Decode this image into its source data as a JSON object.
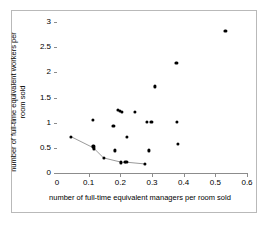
{
  "chart_data": {
    "type": "scatter",
    "title": "",
    "xlabel": "number of full-time equivalent managers per room sold",
    "ylabel": "number of full-time equivalent workers per room sold",
    "xlim": [
      0,
      0.6
    ],
    "ylim": [
      0,
      3
    ],
    "xticks": [
      "0",
      "0.1",
      "0.2",
      "0.3",
      "0.4",
      "0.5",
      "0.6"
    ],
    "xtick_values": [
      0,
      0.1,
      0.2,
      0.3,
      0.4,
      0.5,
      0.6
    ],
    "yticks": [
      "0",
      "0.5",
      "1",
      "1.5",
      "2",
      "2.5",
      "3"
    ],
    "ytick_values": [
      0,
      0.5,
      1,
      1.5,
      2,
      2.5,
      3
    ],
    "grid": false,
    "legend": null,
    "marker_color": "#000000",
    "frontier_line_color": "#808080",
    "points": [
      {
        "x": 0.045,
        "y": 0.72
      },
      {
        "x": 0.113,
        "y": 1.05
      },
      {
        "x": 0.115,
        "y": 0.53
      },
      {
        "x": 0.117,
        "y": 0.49
      },
      {
        "x": 0.147,
        "y": 0.3
      },
      {
        "x": 0.178,
        "y": 0.94
      },
      {
        "x": 0.183,
        "y": 0.45
      },
      {
        "x": 0.192,
        "y": 1.25
      },
      {
        "x": 0.199,
        "y": 1.24
      },
      {
        "x": 0.206,
        "y": 1.21
      },
      {
        "x": 0.203,
        "y": 0.21
      },
      {
        "x": 0.214,
        "y": 0.22
      },
      {
        "x": 0.219,
        "y": 0.215
      },
      {
        "x": 0.222,
        "y": 0.72
      },
      {
        "x": 0.247,
        "y": 1.22
      },
      {
        "x": 0.277,
        "y": 0.18
      },
      {
        "x": 0.283,
        "y": 1.01
      },
      {
        "x": 0.29,
        "y": 0.45
      },
      {
        "x": 0.298,
        "y": 1.01
      },
      {
        "x": 0.31,
        "y": 1.72
      },
      {
        "x": 0.377,
        "y": 2.18
      },
      {
        "x": 0.379,
        "y": 1.02
      },
      {
        "x": 0.381,
        "y": 0.57
      },
      {
        "x": 0.532,
        "y": 2.82
      }
    ],
    "frontier_points": [
      {
        "x": 0.045,
        "y": 0.72
      },
      {
        "x": 0.115,
        "y": 0.5
      },
      {
        "x": 0.147,
        "y": 0.3
      },
      {
        "x": 0.206,
        "y": 0.21
      },
      {
        "x": 0.219,
        "y": 0.215
      },
      {
        "x": 0.277,
        "y": 0.18
      }
    ]
  }
}
